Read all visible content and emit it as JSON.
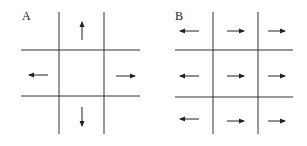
{
  "panels": [
    {
      "label": "A",
      "description": "3x3 grid, arrows pointing outward from center cell"
    },
    {
      "label": "B",
      "description": "3x3 grid, left column arrows point left, other columns point right"
    }
  ]
}
